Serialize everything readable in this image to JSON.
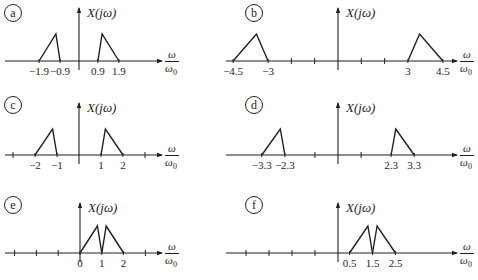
{
  "figure": {
    "y_axis_label": "X(jω)",
    "x_axis_label_num": "ω",
    "x_axis_label_den": "ω",
    "x_axis_label_den_sub": "0",
    "color": "#231f20"
  },
  "chart_data": [
    {
      "type": "line",
      "panel": "a",
      "title": "a",
      "ylabel": "X(jω)",
      "xlabel": "ω/ω0",
      "ticks": [],
      "tick_labels": [
        {
          "x": -1.9,
          "text": "−1.9"
        },
        {
          "x": -0.9,
          "text": "−0.9"
        },
        {
          "x": 0.9,
          "text": "0.9"
        },
        {
          "x": 1.9,
          "text": "1.9"
        }
      ],
      "series": [
        {
          "name": "left-triangle",
          "points": [
            [
              -1.9,
              0
            ],
            [
              -1.1,
              1
            ],
            [
              -0.9,
              0
            ]
          ]
        },
        {
          "name": "right-triangle",
          "points": [
            [
              0.9,
              0
            ],
            [
              1.1,
              1
            ],
            [
              1.9,
              0
            ]
          ]
        }
      ]
    },
    {
      "type": "line",
      "panel": "b",
      "title": "b",
      "ylabel": "X(jω)",
      "xlabel": "ω/ω0",
      "ticks": [
        -2,
        -1,
        1,
        2
      ],
      "tick_labels": [
        {
          "x": -4.5,
          "text": "−4.5"
        },
        {
          "x": -3,
          "text": "−3"
        },
        {
          "x": 3,
          "text": "3"
        },
        {
          "x": 4.5,
          "text": "4.5"
        }
      ],
      "series": [
        {
          "name": "left-triangle",
          "points": [
            [
              -4.5,
              0
            ],
            [
              -3.5,
              1
            ],
            [
              -3,
              0
            ]
          ]
        },
        {
          "name": "right-triangle",
          "points": [
            [
              3,
              0
            ],
            [
              3.5,
              1
            ],
            [
              4.5,
              0
            ]
          ]
        }
      ]
    },
    {
      "type": "line",
      "panel": "c",
      "title": "c",
      "ylabel": "X(jω)",
      "xlabel": "ω/ω0",
      "ticks": [
        -3,
        3
      ],
      "tick_labels": [
        {
          "x": -2,
          "text": "−2"
        },
        {
          "x": -1,
          "text": "−1"
        },
        {
          "x": 1,
          "text": "1"
        },
        {
          "x": 2,
          "text": "2"
        }
      ],
      "series": [
        {
          "name": "left-triangle",
          "points": [
            [
              -2,
              0
            ],
            [
              -1.2,
              1
            ],
            [
              -1,
              0
            ]
          ]
        },
        {
          "name": "right-triangle",
          "points": [
            [
              1,
              0
            ],
            [
              1.2,
              1
            ],
            [
              2,
              0
            ]
          ]
        }
      ]
    },
    {
      "type": "line",
      "panel": "d",
      "title": "d",
      "ylabel": "X(jω)",
      "xlabel": "ω/ω0",
      "ticks": [
        -1,
        1
      ],
      "tick_labels": [
        {
          "x": -3.3,
          "text": "−3.3"
        },
        {
          "x": -2.3,
          "text": "−2.3"
        },
        {
          "x": 2.3,
          "text": "2.3"
        },
        {
          "x": 3.3,
          "text": "3.3"
        }
      ],
      "series": [
        {
          "name": "left-triangle",
          "points": [
            [
              -3.3,
              0
            ],
            [
              -2.5,
              1
            ],
            [
              -2.3,
              0
            ]
          ]
        },
        {
          "name": "right-triangle",
          "points": [
            [
              2.3,
              0
            ],
            [
              2.5,
              1
            ],
            [
              3.3,
              0
            ]
          ]
        }
      ]
    },
    {
      "type": "line",
      "panel": "e",
      "title": "e",
      "ylabel": "X(jω)",
      "xlabel": "ω/ω0",
      "ticks": [
        -3,
        -2,
        -1,
        3
      ],
      "tick_labels": [
        {
          "x": 0,
          "text": "0"
        },
        {
          "x": 1,
          "text": "1"
        },
        {
          "x": 2,
          "text": "2"
        }
      ],
      "series": [
        {
          "name": "left-triangle",
          "points": [
            [
              0,
              0
            ],
            [
              0.8,
              1
            ],
            [
              1,
              0
            ]
          ]
        },
        {
          "name": "right-triangle",
          "points": [
            [
              1,
              0
            ],
            [
              1.2,
              1
            ],
            [
              2,
              0
            ]
          ]
        }
      ]
    },
    {
      "type": "line",
      "panel": "f",
      "title": "f",
      "ylabel": "X(jω)",
      "xlabel": "ω/ω0",
      "ticks": [
        -4,
        -3,
        -2,
        -1
      ],
      "tick_labels": [
        {
          "x": 0.5,
          "text": "0.5"
        },
        {
          "x": 1.5,
          "text": "1.5"
        },
        {
          "x": 2.5,
          "text": "2.5"
        }
      ],
      "series": [
        {
          "name": "left-triangle",
          "points": [
            [
              0.5,
              0
            ],
            [
              1.3,
              1
            ],
            [
              1.5,
              0
            ]
          ]
        },
        {
          "name": "right-triangle",
          "points": [
            [
              1.5,
              0
            ],
            [
              1.7,
              1
            ],
            [
              2.5,
              0
            ]
          ]
        }
      ]
    }
  ]
}
